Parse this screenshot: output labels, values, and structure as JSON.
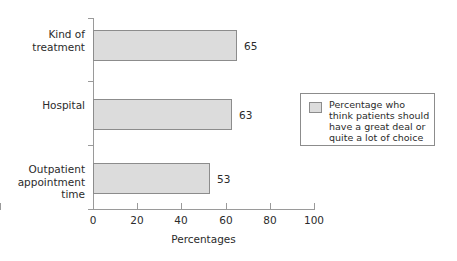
{
  "chart_data": {
    "type": "bar",
    "orientation": "horizontal",
    "title": "",
    "categories": [
      "Kind of\ntreatment",
      "Hospital",
      "Outpatient\nappointment\ntime"
    ],
    "values": [
      65,
      63,
      53
    ],
    "value_labels": [
      "65",
      "63",
      "53"
    ],
    "xlabel": "Percentages",
    "ylabel": "",
    "xlim": [
      0,
      100
    ],
    "xticks": [
      0,
      20,
      40,
      60,
      80,
      100
    ],
    "xtick_labels": [
      "0",
      "20",
      "40",
      "60",
      "80",
      "100"
    ],
    "grid": false,
    "legend": {
      "position": "right",
      "entries": [
        {
          "label": "Percentage who\nthink patients should\nhave a great deal or\nquite a lot of choice",
          "color": "#dcdcdc"
        }
      ]
    },
    "colors": {
      "bar_fill": "#dcdcdc",
      "bar_edge": "#8c8c8c",
      "axis": "#9a9a9a",
      "text": "#2b2b2b",
      "background": "#ffffff"
    }
  }
}
